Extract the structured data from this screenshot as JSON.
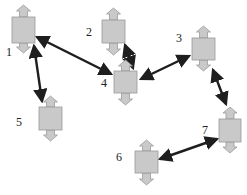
{
  "diagram": {
    "width": 247,
    "height": 195,
    "colors": {
      "node_fill": "#c9c9c9",
      "node_stroke": "#9a9a9a",
      "edge": "#1e1e1e",
      "label": "#222222",
      "background": "#ffffff"
    },
    "node_shape": "box-with-vertical-double-arrow",
    "nodes": [
      {
        "id": "1",
        "label": "1",
        "x": 12,
        "y": 17,
        "w": 23,
        "h": 26,
        "top_tip": 5,
        "bottom_tip": 53,
        "label_x": 6,
        "label_y": 56
      },
      {
        "id": "2",
        "label": "2",
        "x": 102,
        "y": 20,
        "w": 23,
        "h": 23,
        "top_tip": 8,
        "bottom_tip": 55,
        "label_x": 86,
        "label_y": 36
      },
      {
        "id": "3",
        "label": "3",
        "x": 192,
        "y": 38,
        "w": 23,
        "h": 22,
        "top_tip": 26,
        "bottom_tip": 71,
        "label_x": 176,
        "label_y": 42
      },
      {
        "id": "4",
        "label": "4",
        "x": 114,
        "y": 71,
        "w": 23,
        "h": 22,
        "top_tip": 60,
        "bottom_tip": 105,
        "label_x": 101,
        "label_y": 87
      },
      {
        "id": "5",
        "label": "5",
        "x": 39,
        "y": 107,
        "w": 23,
        "h": 23,
        "top_tip": 96,
        "bottom_tip": 141,
        "label_x": 16,
        "label_y": 126
      },
      {
        "id": "6",
        "label": "6",
        "x": 135,
        "y": 151,
        "w": 23,
        "h": 22,
        "top_tip": 140,
        "bottom_tip": 185,
        "label_x": 116,
        "label_y": 161
      },
      {
        "id": "7",
        "label": "7",
        "x": 219,
        "y": 119,
        "w": 22,
        "h": 23,
        "top_tip": 107,
        "bottom_tip": 153,
        "label_x": 202,
        "label_y": 134
      }
    ],
    "edges": [
      {
        "from": "1",
        "to": "4",
        "x1": 37,
        "y1": 37,
        "x2": 111,
        "y2": 74,
        "bidirectional": true
      },
      {
        "from": "1",
        "to": "5",
        "x1": 34,
        "y1": 46,
        "x2": 42,
        "y2": 101,
        "bidirectional": true
      },
      {
        "from": "2",
        "to": "4",
        "x1": 125,
        "y1": 45,
        "x2": 133,
        "y2": 68,
        "bidirectional": true
      },
      {
        "from": "4",
        "to": "3",
        "x1": 141,
        "y1": 79,
        "x2": 189,
        "y2": 56,
        "bidirectional": true
      },
      {
        "from": "3",
        "to": "7",
        "x1": 213,
        "y1": 70,
        "x2": 226,
        "y2": 104,
        "bidirectional": true
      },
      {
        "from": "6",
        "to": "7",
        "x1": 160,
        "y1": 159,
        "x2": 217,
        "y2": 139,
        "bidirectional": true
      }
    ]
  }
}
